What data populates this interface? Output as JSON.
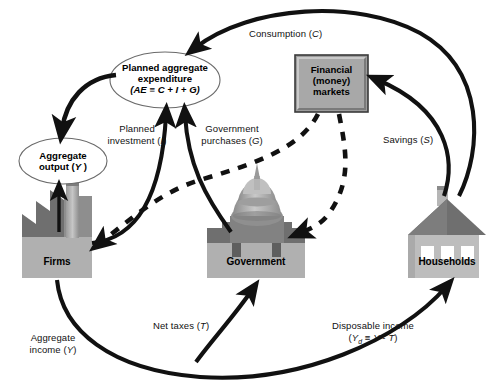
{
  "diagram": {
    "type": "economics-circular-flow"
  },
  "nodes": {
    "aggregate_expenditure": {
      "name": "planned-aggregate-expenditure",
      "line1": "Planned aggregate",
      "line2": "expenditure",
      "line3": "(AE ≡ C + I + G)",
      "shape": "ellipse",
      "fill": "#ffffff"
    },
    "aggregate_output": {
      "name": "aggregate-output",
      "line1": "Aggregate",
      "line2": "output (Y )",
      "shape": "ellipse",
      "fill": "#ffffff"
    },
    "financial_markets": {
      "name": "financial-money-markets",
      "line1": "Financial",
      "line2": "(money)",
      "line3": "markets",
      "shape": "rectangle",
      "fill": "#9c9c9c"
    },
    "firms": {
      "name": "firms",
      "label": "Firms",
      "icon": "factory-icon"
    },
    "government": {
      "name": "government",
      "label": "Government",
      "icon": "capitol-building-icon"
    },
    "households": {
      "name": "households",
      "label": "Households",
      "icon": "house-icon"
    }
  },
  "flows": [
    {
      "id": "consumption",
      "label": "Consumption (C)",
      "from": "households",
      "to": "aggregate_expenditure",
      "style": "solid"
    },
    {
      "id": "savings",
      "label": "Savings (S)",
      "from": "households",
      "to": "financial_markets",
      "style": "solid"
    },
    {
      "id": "planned_investment",
      "label_line1": "Planned",
      "label_line2": "investment (I)",
      "from": "firms",
      "to": "aggregate_expenditure",
      "style": "solid"
    },
    {
      "id": "government_purchases",
      "label_line1": "Government",
      "label_line2": "purchases (G)",
      "from": "government",
      "to": "aggregate_expenditure",
      "style": "solid"
    },
    {
      "id": "net_taxes",
      "label": "Net taxes (T)",
      "from": "households",
      "to": "government",
      "style": "solid"
    },
    {
      "id": "disposable_income",
      "label_line1": "Disposable income",
      "label_line2": "(Yd ≡ Y - T)",
      "from": "firms",
      "to": "households",
      "style": "solid"
    },
    {
      "id": "aggregate_income",
      "label_line1": "Aggregate",
      "label_line2": "income (Y)",
      "from": "firms",
      "to": "households",
      "style": "solid"
    },
    {
      "id": "output_to_ae",
      "label": "",
      "from": "aggregate_expenditure",
      "to": "aggregate_output",
      "style": "solid"
    },
    {
      "id": "firms_to_output",
      "label": "",
      "from": "firms",
      "to": "aggregate_output",
      "style": "solid"
    },
    {
      "id": "funds_to_firms",
      "label": "",
      "from": "financial_markets",
      "to": "firms",
      "style": "dashed"
    },
    {
      "id": "funds_to_government",
      "label": "",
      "from": "financial_markets",
      "to": "government",
      "style": "dashed"
    }
  ],
  "labels": {
    "consumption": "Consumption (C)",
    "savings": "Savings (S)",
    "planned_investment_l1": "Planned",
    "planned_investment_l2": "investment (I)",
    "government_purchases_l1": "Government",
    "government_purchases_l2": "purchases (G)",
    "net_taxes": "Net taxes (T)",
    "disposable_income_l1": "Disposable income",
    "disposable_income_l2": "(Yd ≡ Y - T)",
    "aggregate_income_l1": "Aggregate",
    "aggregate_income_l2": "income (Y)"
  },
  "colors": {
    "stroke": "#111111",
    "background": "#ffffff",
    "box_fill": "#9c9c9c",
    "box_light": "#b8b8b8",
    "roof_dark": "#6f6f6f",
    "body_mid": "#a6a6a6",
    "body_light": "#c3c3c3",
    "white": "#ffffff"
  }
}
